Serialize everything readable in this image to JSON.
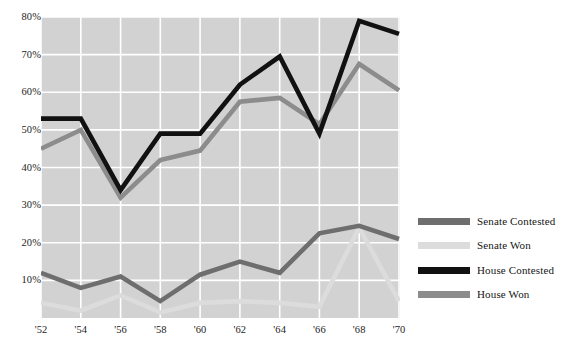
{
  "chart_data": {
    "type": "line",
    "title": "",
    "subtitle": "",
    "xlabel": "",
    "ylabel": "",
    "x": [
      "'52",
      "'54",
      "'56",
      "'58",
      "'60",
      "'62",
      "'64",
      "'66",
      "'68",
      "'70"
    ],
    "categories": [
      "'52",
      "'54",
      "'56",
      "'58",
      "'60",
      "'62",
      "'64",
      "'66",
      "'68",
      "'70"
    ],
    "xlim": [
      1952,
      1970
    ],
    "ylim": [
      0,
      80
    ],
    "ytick_labels": [
      "10%",
      "20%",
      "30%",
      "40%",
      "50%",
      "60%",
      "70%",
      "80%"
    ],
    "ytick_values": [
      10,
      20,
      30,
      40,
      50,
      60,
      70,
      80
    ],
    "grid": true,
    "grid_color": "#ffffff",
    "plot_background": "#d2d2d2",
    "legend_position": "right",
    "series": [
      {
        "name": "Senate Contested",
        "color": "#6e6e6e",
        "values": [
          12.0,
          8.0,
          11.0,
          4.5,
          11.5,
          15.0,
          12.0,
          22.5,
          24.5,
          21.0
        ]
      },
      {
        "name": "Senate Won",
        "color": "#dcdcdc",
        "values": [
          4.0,
          2.0,
          6.0,
          1.5,
          4.0,
          4.5,
          4.0,
          3.0,
          24.0,
          4.5
        ]
      },
      {
        "name": "House Contested",
        "color": "#111111",
        "values": [
          53.0,
          53.0,
          34.0,
          49.0,
          49.0,
          62.0,
          69.5,
          49.0,
          79.0,
          75.5
        ]
      },
      {
        "name": "House Won",
        "color": "#8c8c8c",
        "values": [
          45.0,
          50.0,
          32.0,
          42.0,
          44.5,
          57.5,
          58.5,
          51.5,
          67.5,
          60.5
        ]
      }
    ]
  },
  "legend": {
    "items": [
      {
        "label": "Senate Contested",
        "color": "#6e6e6e"
      },
      {
        "label": "Senate Won",
        "color": "#dcdcdc"
      },
      {
        "label": "House Contested",
        "color": "#111111"
      },
      {
        "label": "House Won",
        "color": "#8c8c8c"
      }
    ]
  }
}
